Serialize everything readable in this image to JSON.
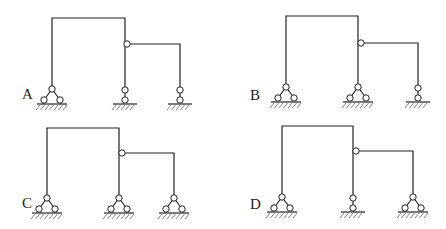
{
  "options": [
    {
      "label": "A",
      "label_pos": [
        22,
        99
      ],
      "left_col_x": 52,
      "top_y": 18,
      "mid_col_x": 125,
      "hinge": [
        127,
        44
      ],
      "right_col_x": 180,
      "base_y": 104,
      "supports": [
        "fixed-hinge",
        "link",
        "link"
      ]
    },
    {
      "label": "B",
      "label_pos": [
        250,
        100
      ],
      "left_col_x": 286,
      "top_y": 16,
      "mid_col_x": 358,
      "hinge": [
        361,
        43
      ],
      "right_col_x": 418,
      "base_y": 102,
      "supports": [
        "fixed-hinge",
        "fixed-hinge",
        "link"
      ]
    },
    {
      "label": "C",
      "label_pos": [
        22,
        208
      ],
      "left_col_x": 47,
      "top_y": 128,
      "mid_col_x": 119,
      "hinge": [
        122,
        153
      ],
      "right_col_x": 174,
      "base_y": 213,
      "supports": [
        "fixed-hinge",
        "fixed-hinge",
        "fixed-hinge"
      ]
    },
    {
      "label": "D",
      "label_pos": [
        250,
        209
      ],
      "left_col_x": 282,
      "top_y": 126,
      "mid_col_x": 353,
      "hinge": [
        356,
        151
      ],
      "right_col_x": 413,
      "base_y": 212,
      "supports": [
        "fixed-hinge",
        "link",
        "fixed-hinge"
      ]
    }
  ]
}
